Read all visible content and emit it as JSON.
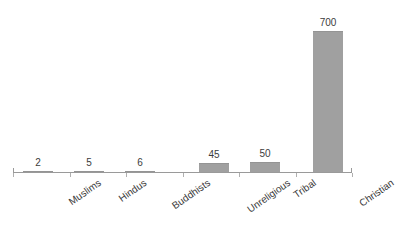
{
  "chart_data": {
    "type": "bar",
    "title": "",
    "xlabel": "",
    "ylabel": "",
    "categories": [
      "Muslims",
      "Hindus",
      "Buddhists",
      "Unreligious",
      "Tribal",
      "Christian"
    ],
    "values": [
      2,
      5,
      6,
      45,
      50,
      700
    ],
    "value_labels": [
      "2",
      "5",
      "6",
      "45",
      "50",
      "700"
    ],
    "ylim": [
      0,
      700
    ],
    "grid": false,
    "legend": null,
    "bar_color": "#a0a0a0",
    "axis_color": "#9a9a9a",
    "background_color": "#ffffff"
  },
  "axis": {
    "baseline_name": "x-axis",
    "tick_count": 7
  }
}
